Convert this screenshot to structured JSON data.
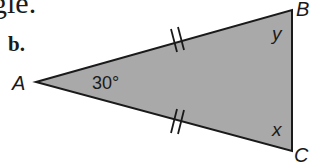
{
  "header": {
    "cropped_text": "gle.",
    "part_label": "b."
  },
  "figure": {
    "type": "isosceles-triangle",
    "fill_color": "#a9a9a9",
    "stroke_color": "#1a1a1a",
    "vertices": {
      "A": {
        "label": "A",
        "x": 36,
        "y": 82
      },
      "B": {
        "label": "B",
        "x": 292,
        "y": 10
      },
      "C": {
        "label": "C",
        "x": 292,
        "y": 151
      }
    },
    "angles": {
      "A": "30°",
      "B": "y",
      "C": "x"
    },
    "congruent_sides": [
      "AB",
      "AC"
    ],
    "tick_marks": "double"
  }
}
